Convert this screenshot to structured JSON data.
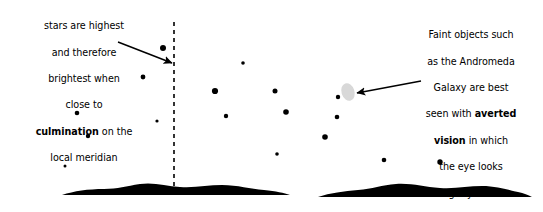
{
  "figure": {
    "background_color": "#ffffff",
    "ink_color": "#000000",
    "galaxy_color": "#d8d8d8"
  },
  "annotations": {
    "left": {
      "id": "culmination-note",
      "lines": [
        "stars are highest",
        "and therefore",
        "brightest when",
        "close to"
      ],
      "bold_term": "culmination",
      "after_bold": " on the",
      "last_line": "local meridian",
      "full_text": "stars are highest and therefore brightest when close to culmination on the local meridian"
    },
    "right": {
      "id": "averted-vision-note",
      "lines": [
        "Faint objects such",
        "as the Andromeda",
        "Galaxy are best",
        "seen with "
      ],
      "bold_term_1": "averted",
      "bold_term_2": "vision",
      "after_bold": " in which",
      "tail_lines": [
        "the eye looks",
        "slightly to the",
        "side of them"
      ],
      "full_text": "Faint objects such as the Andromeda Galaxy are best seen with averted vision in which the eye looks slightly to the side of them"
    }
  },
  "meridian": {
    "label": "local-meridian",
    "style": "dashed",
    "x": 174,
    "y_top": 22,
    "y_bottom": 192,
    "dash": "4 4",
    "width": 1.6
  },
  "arrows": [
    {
      "name": "arrow-to-meridian",
      "x1": 118,
      "y1": 42,
      "x2": 172,
      "y2": 63
    },
    {
      "name": "arrow-to-galaxy",
      "x1": 421,
      "y1": 81,
      "x2": 357,
      "y2": 93
    }
  ],
  "galaxy": {
    "name": "andromeda-galaxy",
    "cx": 348,
    "cy": 92,
    "rx": 6.5,
    "ry": 9,
    "rotate": -18,
    "fill": "#d8d8d8"
  },
  "stars": [
    {
      "cx": 163,
      "cy": 48,
      "r": 3.0
    },
    {
      "cx": 143,
      "cy": 77,
      "r": 2.4
    },
    {
      "cx": 77,
      "cy": 113,
      "r": 2.3
    },
    {
      "cx": 88,
      "cy": 136,
      "r": 2.2
    },
    {
      "cx": 65,
      "cy": 166,
      "r": 1.5
    },
    {
      "cx": 243,
      "cy": 63,
      "r": 1.8
    },
    {
      "cx": 215,
      "cy": 91,
      "r": 3.1
    },
    {
      "cx": 275,
      "cy": 91,
      "r": 2.5
    },
    {
      "cx": 157,
      "cy": 121,
      "r": 1.6
    },
    {
      "cx": 226,
      "cy": 116,
      "r": 2.2
    },
    {
      "cx": 286,
      "cy": 112,
      "r": 2.8
    },
    {
      "cx": 277,
      "cy": 154,
      "r": 1.8
    },
    {
      "cx": 338,
      "cy": 97,
      "r": 2.2
    },
    {
      "cx": 337,
      "cy": 117,
      "r": 2.3
    },
    {
      "cx": 325,
      "cy": 137,
      "r": 2.8
    },
    {
      "cx": 384,
      "cy": 160,
      "r": 2.3
    },
    {
      "cx": 440,
      "cy": 162,
      "r": 2.7
    }
  ],
  "horizons": [
    {
      "name": "horizon-left",
      "path": "M 62,195 C 74,191 88,189 104,189 C 118,189 126,186 140,184 C 154,182 166,186 180,187 C 196,188 208,185 222,185 C 238,185 250,189 264,190 C 276,191 284,193 290,195 Z"
    },
    {
      "name": "horizon-right",
      "path": "M 318,197 C 330,193 344,191 358,190 C 372,189 382,185 396,184 C 412,183 424,187 440,188 C 456,189 468,186 482,186 C 496,186 508,190 518,192 C 524,193 528,195 532,197 Z"
    }
  ]
}
